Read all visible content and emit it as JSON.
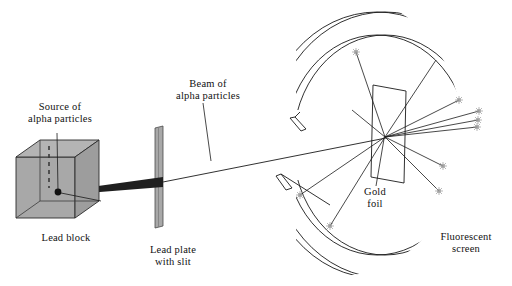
{
  "figure": {
    "background_color": "#ffffff",
    "line_color": "#1a1a1a",
    "lead_fill": "#a8a8a8",
    "beam_fill": "#1f1f1f",
    "flash_color": "#9a9a9a"
  },
  "labels": {
    "source": "Source of\nalpha particles",
    "lead_block": "Lead block",
    "beam": "Beam of\nalpha particles",
    "lead_plate": "Lead plate\nwith slit",
    "gold_foil": "Gold\nfoil",
    "screen": "Fluorescent\nscreen"
  },
  "components": {
    "lead_block": {
      "name": "lead-block",
      "shape": "cube",
      "fill": "#a8a8a8"
    },
    "lead_plate": {
      "name": "lead-plate-with-slit",
      "shape": "thin-vertical-plate",
      "fill": "#a8a8a8"
    },
    "gold_foil": {
      "name": "gold-foil",
      "shape": "parallelogram"
    },
    "fluorescent_screen": {
      "name": "fluorescent-screen",
      "shape": "circular-band-with-gap"
    }
  },
  "scattering": {
    "origin_x": 385,
    "origin_y": 137,
    "ray_count": 11,
    "flash_count": 9
  }
}
